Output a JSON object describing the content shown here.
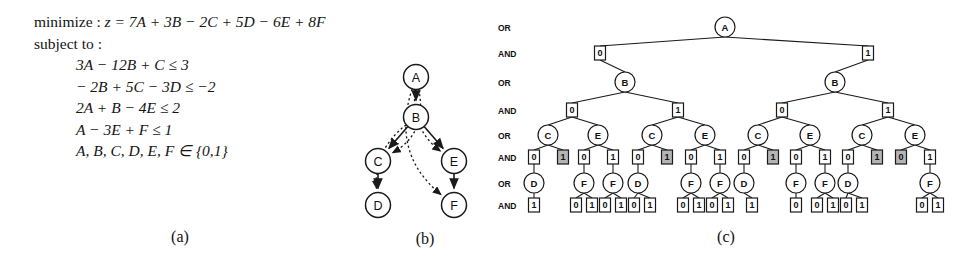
{
  "figure": {
    "captions": [
      {
        "id": "a",
        "text": "(a)"
      },
      {
        "id": "b",
        "text": "(b)"
      },
      {
        "id": "c",
        "text": "(c)"
      }
    ]
  },
  "model": {
    "objective_prefix": "minimize : ",
    "objective": "z = 7A + 3B − 2C + 5D − 6E + 8F",
    "subject_to_label": "subject to :",
    "constraints": [
      "3A − 12B + C ≤ 3",
      "− 2B + 5C − 3D ≤ −2",
      "2A + B − 4E ≤ 2",
      "A − 3E + F ≤ 1",
      "A, B, C, D, E, F ∈ {0,1}"
    ]
  },
  "precedence_graph": {
    "nodes": [
      {
        "id": "A",
        "label": "A",
        "x": 66,
        "y": 22
      },
      {
        "id": "B",
        "label": "B",
        "x": 66,
        "y": 62
      },
      {
        "id": "C",
        "label": "C",
        "x": 28,
        "y": 106
      },
      {
        "id": "E",
        "label": "E",
        "x": 104,
        "y": 106
      },
      {
        "id": "D",
        "label": "D",
        "x": 28,
        "y": 150
      },
      {
        "id": "F",
        "label": "F",
        "x": 104,
        "y": 150
      }
    ],
    "solid_edges": [
      [
        "A",
        "B"
      ],
      [
        "B",
        "C"
      ],
      [
        "B",
        "E"
      ],
      [
        "C",
        "D"
      ],
      [
        "E",
        "F"
      ]
    ],
    "dotted_edges": [
      [
        "A",
        "C"
      ],
      [
        "B",
        "D"
      ],
      [
        "A",
        "E"
      ],
      [
        "A",
        "F"
      ]
    ]
  },
  "search_tree": {
    "row_labels": [
      "OR",
      "AND",
      "OR",
      "AND",
      "OR",
      "AND",
      "OR",
      "AND"
    ],
    "row_y": [
      27,
      53,
      82,
      110,
      135,
      157,
      183,
      205
    ],
    "root": {
      "label": "A",
      "x": 725,
      "y": 27
    },
    "level_and1": [
      {
        "value": "0",
        "x": 600,
        "y": 53,
        "shaded": false
      },
      {
        "value": "1",
        "x": 868,
        "y": 53,
        "shaded": false
      }
    ],
    "level_or2": [
      {
        "label": "B",
        "x": 625,
        "y": 82
      },
      {
        "label": "B",
        "x": 835,
        "y": 82
      }
    ],
    "level_and2": [
      {
        "value": "0",
        "x": 572,
        "y": 110,
        "shaded": false
      },
      {
        "value": "1",
        "x": 678,
        "y": 110,
        "shaded": false
      },
      {
        "value": "0",
        "x": 782,
        "y": 110,
        "shaded": false
      },
      {
        "value": "1",
        "x": 888,
        "y": 110,
        "shaded": false
      }
    ],
    "level_or3": [
      {
        "label": "C",
        "x": 548,
        "y": 135
      },
      {
        "label": "E",
        "x": 598,
        "y": 135
      },
      {
        "label": "C",
        "x": 652,
        "y": 135
      },
      {
        "label": "E",
        "x": 705,
        "y": 135
      },
      {
        "label": "C",
        "x": 758,
        "y": 135
      },
      {
        "label": "E",
        "x": 810,
        "y": 135
      },
      {
        "label": "C",
        "x": 862,
        "y": 135
      },
      {
        "label": "E",
        "x": 915,
        "y": 135
      }
    ],
    "level_and3": [
      {
        "value": "0",
        "x": 534,
        "y": 157,
        "shaded": false
      },
      {
        "value": "1",
        "x": 563,
        "y": 157,
        "shaded": true
      },
      {
        "value": "0",
        "x": 584,
        "y": 157,
        "shaded": false
      },
      {
        "value": "1",
        "x": 613,
        "y": 157,
        "shaded": false
      },
      {
        "value": "0",
        "x": 638,
        "y": 157,
        "shaded": false
      },
      {
        "value": "1",
        "x": 667,
        "y": 157,
        "shaded": true
      },
      {
        "value": "0",
        "x": 691,
        "y": 157,
        "shaded": false
      },
      {
        "value": "1",
        "x": 720,
        "y": 157,
        "shaded": false
      },
      {
        "value": "0",
        "x": 744,
        "y": 157,
        "shaded": false
      },
      {
        "value": "1",
        "x": 773,
        "y": 157,
        "shaded": true
      },
      {
        "value": "0",
        "x": 796,
        "y": 157,
        "shaded": false
      },
      {
        "value": "1",
        "x": 825,
        "y": 157,
        "shaded": false
      },
      {
        "value": "0",
        "x": 848,
        "y": 157,
        "shaded": false
      },
      {
        "value": "1",
        "x": 877,
        "y": 157,
        "shaded": true
      },
      {
        "value": "0",
        "x": 901,
        "y": 157,
        "shaded": true
      },
      {
        "value": "1",
        "x": 930,
        "y": 157,
        "shaded": false
      }
    ],
    "level_or4": [
      {
        "label": "D",
        "x": 534,
        "y": 183
      },
      {
        "label": "F",
        "x": 584,
        "y": 183
      },
      {
        "label": "F",
        "x": 613,
        "y": 183
      },
      {
        "label": "D",
        "x": 638,
        "y": 183
      },
      {
        "label": "F",
        "x": 691,
        "y": 183
      },
      {
        "label": "F",
        "x": 720,
        "y": 183
      },
      {
        "label": "D",
        "x": 744,
        "y": 183
      },
      {
        "label": "F",
        "x": 796,
        "y": 183
      },
      {
        "label": "F",
        "x": 825,
        "y": 183
      },
      {
        "label": "D",
        "x": 848,
        "y": 183
      },
      {
        "label": "F",
        "x": 930,
        "y": 183
      }
    ],
    "level_and4": [
      {
        "value": "1",
        "x": 534,
        "y": 205,
        "parent": 0,
        "shaded": false
      },
      {
        "value": "0",
        "x": 576,
        "y": 205,
        "parent": 1,
        "shaded": false
      },
      {
        "value": "1",
        "x": 592,
        "y": 205,
        "parent": 1,
        "shaded": false
      },
      {
        "value": "0",
        "x": 605,
        "y": 205,
        "parent": 2,
        "shaded": false
      },
      {
        "value": "1",
        "x": 621,
        "y": 205,
        "parent": 2,
        "shaded": false
      },
      {
        "value": "0",
        "x": 634,
        "y": 205,
        "parent": 3,
        "shaded": false
      },
      {
        "value": "1",
        "x": 650,
        "y": 205,
        "parent": 3,
        "shaded": false
      },
      {
        "value": "0",
        "x": 683,
        "y": 205,
        "parent": 4,
        "shaded": false
      },
      {
        "value": "1",
        "x": 699,
        "y": 205,
        "parent": 4,
        "shaded": false
      },
      {
        "value": "0",
        "x": 712,
        "y": 205,
        "parent": 5,
        "shaded": false
      },
      {
        "value": "1",
        "x": 728,
        "y": 205,
        "parent": 5,
        "shaded": false
      },
      {
        "value": "1",
        "x": 752,
        "y": 205,
        "parent": 6,
        "shaded": false
      },
      {
        "value": "0",
        "x": 796,
        "y": 205,
        "parent": 7,
        "shaded": false
      },
      {
        "value": "0",
        "x": 817,
        "y": 205,
        "parent": 8,
        "shaded": false
      },
      {
        "value": "1",
        "x": 833,
        "y": 205,
        "parent": 8,
        "shaded": false
      },
      {
        "value": "0",
        "x": 846,
        "y": 205,
        "parent": 9,
        "shaded": false
      },
      {
        "value": "1",
        "x": 862,
        "y": 205,
        "parent": 9,
        "shaded": false
      },
      {
        "value": "0",
        "x": 922,
        "y": 205,
        "parent": 10,
        "shaded": false
      },
      {
        "value": "1",
        "x": 938,
        "y": 205,
        "parent": 10,
        "shaded": false
      }
    ],
    "colors": {
      "stroke": "#1a1a1a",
      "shade_fill": "#b4b4b4",
      "node_fill": "#ffffff"
    }
  }
}
